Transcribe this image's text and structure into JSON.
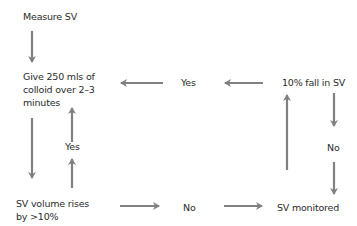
{
  "flowchart": {
    "nodes": {
      "measure_sv": "Measure SV",
      "give_colloid_line1": "Give 250 mls of",
      "give_colloid_line2": "colloid over 2–3",
      "give_colloid_line3": "minutes",
      "sv_rises_line1": "SV volume rises",
      "sv_rises_line2": "by >10%",
      "sv_monitored": "SV monitored",
      "fall_in_sv": "10% fall in SV"
    },
    "edge_labels": {
      "yes_rises": "Yes",
      "no_rises": "No",
      "yes_fall": "Yes",
      "no_fall": "No"
    },
    "colors": {
      "arrow": "#808080",
      "text": "#2b2b2b",
      "background": "#ffffff"
    }
  }
}
